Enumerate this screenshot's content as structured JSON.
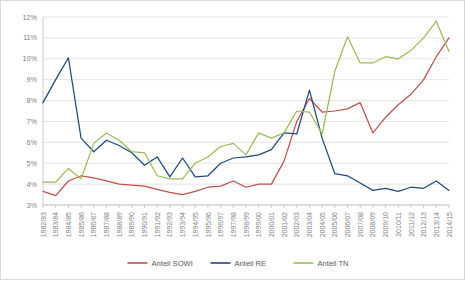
{
  "chart_data": {
    "type": "line",
    "title": "",
    "xlabel": "",
    "ylabel": "",
    "ylim": [
      3,
      12
    ],
    "ytick_labels": [
      "3%",
      "4%",
      "5%",
      "6%",
      "7%",
      "8%",
      "9%",
      "10%",
      "11%",
      "12%"
    ],
    "ytick_values": [
      3,
      4,
      5,
      6,
      7,
      8,
      9,
      10,
      11,
      12
    ],
    "grid": true,
    "legend_position": "bottom",
    "categories": [
      "1982/83",
      "1983/84",
      "1984/85",
      "1985/86",
      "1986/87",
      "1987/88",
      "1988/89",
      "1989/90",
      "1990/91",
      "1991/92",
      "1992/93",
      "1993/94",
      "1994/95",
      "1995/96",
      "1996/97",
      "1997/98",
      "1998/99",
      "1999/00",
      "2000/01",
      "2001/02",
      "2002/03",
      "2003/04",
      "2004/05",
      "2005/06",
      "2006/07",
      "2007/08",
      "2008/09",
      "2009/10",
      "2010/11",
      "2011/12",
      "2012/13",
      "2013/14",
      "2014/15"
    ],
    "series": [
      {
        "name": "Anteil SOWI",
        "color": "#C0504D",
        "values": [
          3.65,
          3.45,
          4.15,
          4.4,
          4.3,
          4.15,
          4.0,
          3.95,
          3.9,
          3.75,
          3.6,
          3.5,
          3.65,
          3.85,
          3.9,
          4.15,
          3.85,
          4.0,
          4.0,
          5.1,
          7.0,
          8.1,
          7.45,
          7.5,
          7.6,
          7.9,
          6.45,
          7.2,
          7.8,
          8.3,
          9.0,
          10.1,
          11.0
        ]
      },
      {
        "name": "Anteil RE",
        "color": "#1F497D",
        "values": [
          7.9,
          9.0,
          10.05,
          6.2,
          5.55,
          6.1,
          5.85,
          5.5,
          4.9,
          5.3,
          4.35,
          5.25,
          4.35,
          4.4,
          5.0,
          5.25,
          5.3,
          5.4,
          5.65,
          6.45,
          6.4,
          8.5,
          6.2,
          4.5,
          4.4,
          4.05,
          3.7,
          3.8,
          3.65,
          3.85,
          3.8,
          4.15,
          3.7
        ]
      },
      {
        "name": "Anteil TN",
        "color": "#9BBB59",
        "values": [
          4.1,
          4.1,
          4.75,
          4.25,
          5.95,
          6.45,
          6.1,
          5.55,
          5.5,
          4.4,
          4.25,
          4.25,
          5.0,
          5.3,
          5.8,
          5.95,
          5.4,
          6.45,
          6.2,
          6.45,
          7.5,
          7.45,
          6.4,
          9.4,
          11.05,
          9.8,
          9.8,
          10.1,
          10.0,
          10.4,
          11.0,
          11.8,
          10.35
        ]
      }
    ]
  }
}
